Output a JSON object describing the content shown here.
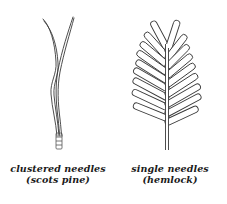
{
  "figures": [
    {
      "id": "pine",
      "caption_line1": "clustered needles",
      "caption_line2": "(scots pine)",
      "needle_count": 2,
      "arrangement": "clustered"
    },
    {
      "id": "hemlock",
      "caption_line1": "single needles",
      "caption_line2": "(hemlock)",
      "needle_count_left": 9,
      "needle_count_right": 9,
      "arrangement": "single"
    }
  ],
  "colors": {
    "line": "#3a3a3a",
    "background": "#ffffff",
    "text": "#1a1a1a"
  }
}
